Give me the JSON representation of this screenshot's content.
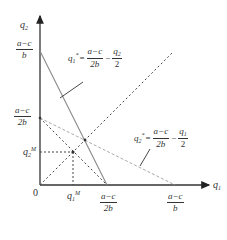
{
  "diagram": {
    "type": "cournot-reaction-functions",
    "axes": {
      "x_label": "q",
      "x_label_sub": "1",
      "y_label": "q",
      "y_label_sub": "2",
      "origin_label": "0"
    },
    "y_ticks": [
      {
        "num": "a−c",
        "den": "b"
      },
      {
        "num": "a−c",
        "den": "2b"
      },
      {
        "text": "q",
        "sub": "2",
        "sup": "M"
      }
    ],
    "x_ticks": [
      {
        "text": "q",
        "sub": "1",
        "sup": "M"
      },
      {
        "num": "a−c",
        "den": "2b"
      },
      {
        "num": "a−c",
        "den": "b"
      }
    ],
    "reaction_1": {
      "lhs": "q",
      "lhs_sub": "1",
      "lhs_sup": "*",
      "eq": "=",
      "frac1_num": "a−c",
      "frac1_den": "2b",
      "minus": "−",
      "frac2_num": "q",
      "frac2_num_sub": "2",
      "frac2_den": "2",
      "line_style": "solid"
    },
    "reaction_2": {
      "lhs": "q",
      "lhs_sub": "2",
      "lhs_sup": "*",
      "eq": "=",
      "frac1_num": "a−c",
      "frac1_den": "2b",
      "minus": "−",
      "frac2_num": "q",
      "frac2_num_sub": "1",
      "frac2_den": "2",
      "line_style": "dashed"
    },
    "colors": {
      "axis": "#333333",
      "reaction_1_line": "#888888",
      "reaction_2_line": "#aaaaaa",
      "dotted": "#444444"
    }
  }
}
